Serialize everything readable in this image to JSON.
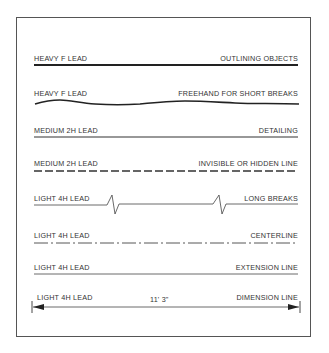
{
  "figure": {
    "rows": [
      {
        "lead": "HEAVY  F  LEAD",
        "use": "OUTLINING OBJECTS",
        "line_type": "heavy-solid"
      },
      {
        "lead": "HEAVY  F  LEAD",
        "use": "FREEHAND FOR SHORT BREAKS",
        "line_type": "freehand-wavy"
      },
      {
        "lead": "MEDIUM  2H  LEAD",
        "use": "DETAILING",
        "line_type": "medium-solid"
      },
      {
        "lead": "MEDIUM  2H  LEAD",
        "use": "INVISIBLE OR HIDDEN LINE",
        "line_type": "dashed"
      },
      {
        "lead": "LIGHT 4H LEAD",
        "use": "LONG BREAKS",
        "line_type": "zigzag-break"
      },
      {
        "lead": "LIGHT 4H LEAD",
        "use": "CENTERLINE",
        "line_type": "dash-dot"
      },
      {
        "lead": "LIGHT 4H LEAD",
        "use": "EXTENSION LINE",
        "line_type": "thin-solid"
      },
      {
        "lead": "LIGHT 4H LEAD",
        "use": "DIMENSION LINE",
        "line_type": "arrowed-dimension"
      }
    ],
    "dimension_value": "11' 3\""
  }
}
